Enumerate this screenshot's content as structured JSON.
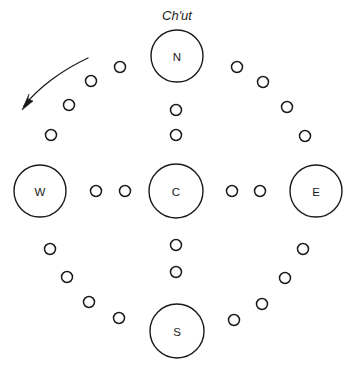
{
  "diagram": {
    "title": "Ch'ut",
    "title_position": {
      "x": 177,
      "y": 15
    },
    "canvas": {
      "width": 351,
      "height": 366
    },
    "stroke_color": "#1a1a1a",
    "background_color": "#ffffff",
    "nodes": [
      {
        "id": "north",
        "label": "N",
        "x": 177,
        "y": 56,
        "r": 26
      },
      {
        "id": "west",
        "label": "W",
        "x": 40,
        "y": 191,
        "r": 26
      },
      {
        "id": "center",
        "label": "C",
        "x": 176,
        "y": 191,
        "r": 27
      },
      {
        "id": "east",
        "label": "E",
        "x": 316,
        "y": 191,
        "r": 26
      },
      {
        "id": "south",
        "label": "S",
        "x": 177,
        "y": 331,
        "r": 27
      }
    ],
    "beads": [
      {
        "group": "upper-left-arc",
        "x": 120,
        "y": 67,
        "r": 5.5
      },
      {
        "group": "upper-left-arc",
        "x": 91,
        "y": 81,
        "r": 5.5
      },
      {
        "group": "upper-left-arc",
        "x": 69,
        "y": 105,
        "r": 5.5
      },
      {
        "group": "upper-left-arc",
        "x": 51,
        "y": 135,
        "r": 5.5
      },
      {
        "group": "upper-right-arc",
        "x": 237,
        "y": 67,
        "r": 5.5
      },
      {
        "group": "upper-right-arc",
        "x": 263,
        "y": 82,
        "r": 5.5
      },
      {
        "group": "upper-right-arc",
        "x": 287,
        "y": 107,
        "r": 5.5
      },
      {
        "group": "upper-right-arc",
        "x": 305,
        "y": 136,
        "r": 5.5
      },
      {
        "group": "lower-left-arc",
        "x": 50,
        "y": 249,
        "r": 5.5
      },
      {
        "group": "lower-left-arc",
        "x": 67,
        "y": 277,
        "r": 5.5
      },
      {
        "group": "lower-left-arc",
        "x": 89,
        "y": 302,
        "r": 5.5
      },
      {
        "group": "lower-left-arc",
        "x": 119,
        "y": 318,
        "r": 5.5
      },
      {
        "group": "lower-right-arc",
        "x": 303,
        "y": 249,
        "r": 5.5
      },
      {
        "group": "lower-right-arc",
        "x": 285,
        "y": 278,
        "r": 5.5
      },
      {
        "group": "lower-right-arc",
        "x": 262,
        "y": 304,
        "r": 5.5
      },
      {
        "group": "lower-right-arc",
        "x": 234,
        "y": 320,
        "r": 5.5
      },
      {
        "group": "vertical-north",
        "x": 176,
        "y": 110,
        "r": 5.5
      },
      {
        "group": "vertical-north",
        "x": 176,
        "y": 135,
        "r": 5.5
      },
      {
        "group": "vertical-south",
        "x": 176,
        "y": 245,
        "r": 5.5
      },
      {
        "group": "vertical-south",
        "x": 176,
        "y": 272,
        "r": 5.5
      },
      {
        "group": "horizontal-west",
        "x": 96,
        "y": 191,
        "r": 5.5
      },
      {
        "group": "horizontal-west",
        "x": 125,
        "y": 191,
        "r": 5.5
      },
      {
        "group": "horizontal-east",
        "x": 232,
        "y": 191,
        "r": 5.5
      },
      {
        "group": "horizontal-east",
        "x": 260,
        "y": 191,
        "r": 5.5
      }
    ],
    "arrow": {
      "name": "counterclockwise-flow-arrow",
      "path": "M 88 58 C 62 70, 38 88, 24 106",
      "head_points": "22,110 33,101 28,99 29,94"
    }
  }
}
